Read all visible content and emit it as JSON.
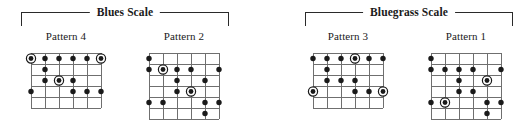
{
  "document": {
    "kind": "guitar-scale-pattern-chart",
    "background_color": "#ffffff",
    "ink_color": "#1a1a1a",
    "grid_color": "#6f6f6f"
  },
  "groups": [
    {
      "id": "blues",
      "title": "Blues Scale",
      "left": 21,
      "width": 208
    },
    {
      "id": "bluegrass",
      "title": "Bluegrass Scale",
      "left": 305,
      "width": 208
    }
  ],
  "patterns": [
    {
      "id": "pattern-4",
      "label": "Pattern 4",
      "group": "blues",
      "left": 16,
      "top": 30,
      "cell_width": 100,
      "strings": 6,
      "frets": 5,
      "string_spacing": 14,
      "fret_spacing": 11,
      "dots": [
        {
          "string": 1,
          "fret": 1,
          "root": true
        },
        {
          "string": 2,
          "fret": 1,
          "root": false
        },
        {
          "string": 3,
          "fret": 1,
          "root": false
        },
        {
          "string": 4,
          "fret": 1,
          "root": false
        },
        {
          "string": 5,
          "fret": 1,
          "root": false
        },
        {
          "string": 6,
          "fret": 1,
          "root": true
        },
        {
          "string": 2,
          "fret": 2,
          "root": false
        },
        {
          "string": 2,
          "fret": 3,
          "root": false
        },
        {
          "string": 3,
          "fret": 3,
          "root": true
        },
        {
          "string": 4,
          "fret": 3,
          "root": false
        },
        {
          "string": 1,
          "fret": 4,
          "root": false
        },
        {
          "string": 4,
          "fret": 4,
          "root": false
        },
        {
          "string": 5,
          "fret": 4,
          "root": false
        },
        {
          "string": 6,
          "fret": 4,
          "root": false
        }
      ]
    },
    {
      "id": "pattern-2",
      "label": "Pattern 2",
      "group": "blues",
      "left": 134,
      "top": 30,
      "cell_width": 100,
      "strings": 6,
      "frets": 6,
      "string_spacing": 14,
      "fret_spacing": 11,
      "dots": [
        {
          "string": 1,
          "fret": 1,
          "root": false
        },
        {
          "string": 1,
          "fret": 2,
          "root": false
        },
        {
          "string": 2,
          "fret": 2,
          "root": true
        },
        {
          "string": 3,
          "fret": 2,
          "root": false
        },
        {
          "string": 4,
          "fret": 2,
          "root": false
        },
        {
          "string": 6,
          "fret": 2,
          "root": false
        },
        {
          "string": 3,
          "fret": 3,
          "root": false
        },
        {
          "string": 5,
          "fret": 3,
          "root": false
        },
        {
          "string": 3,
          "fret": 4,
          "root": false
        },
        {
          "string": 4,
          "fret": 4,
          "root": true
        },
        {
          "string": 1,
          "fret": 5,
          "root": false
        },
        {
          "string": 2,
          "fret": 5,
          "root": false
        },
        {
          "string": 5,
          "fret": 5,
          "root": false
        },
        {
          "string": 6,
          "fret": 5,
          "root": false
        },
        {
          "string": 5,
          "fret": 6,
          "root": false
        }
      ]
    },
    {
      "id": "pattern-3",
      "label": "Pattern 3",
      "group": "bluegrass",
      "left": 298,
      "top": 30,
      "cell_width": 100,
      "strings": 6,
      "frets": 5,
      "string_spacing": 14,
      "fret_spacing": 11,
      "dots": [
        {
          "string": 1,
          "fret": 1,
          "root": false
        },
        {
          "string": 2,
          "fret": 1,
          "root": false
        },
        {
          "string": 3,
          "fret": 1,
          "root": false
        },
        {
          "string": 4,
          "fret": 1,
          "root": true
        },
        {
          "string": 5,
          "fret": 1,
          "root": false
        },
        {
          "string": 6,
          "fret": 1,
          "root": false
        },
        {
          "string": 2,
          "fret": 2,
          "root": false
        },
        {
          "string": 2,
          "fret": 3,
          "root": false
        },
        {
          "string": 3,
          "fret": 3,
          "root": false
        },
        {
          "string": 4,
          "fret": 3,
          "root": false
        },
        {
          "string": 1,
          "fret": 4,
          "root": true
        },
        {
          "string": 4,
          "fret": 4,
          "root": false
        },
        {
          "string": 5,
          "fret": 4,
          "root": false
        },
        {
          "string": 6,
          "fret": 4,
          "root": true
        }
      ]
    },
    {
      "id": "pattern-1",
      "label": "Pattern 1",
      "group": "bluegrass",
      "left": 416,
      "top": 30,
      "cell_width": 100,
      "strings": 6,
      "frets": 6,
      "string_spacing": 14,
      "fret_spacing": 11,
      "dots": [
        {
          "string": 1,
          "fret": 1,
          "root": false
        },
        {
          "string": 1,
          "fret": 2,
          "root": false
        },
        {
          "string": 2,
          "fret": 2,
          "root": false
        },
        {
          "string": 3,
          "fret": 2,
          "root": false
        },
        {
          "string": 4,
          "fret": 2,
          "root": false
        },
        {
          "string": 6,
          "fret": 2,
          "root": false
        },
        {
          "string": 3,
          "fret": 3,
          "root": false
        },
        {
          "string": 5,
          "fret": 3,
          "root": true
        },
        {
          "string": 3,
          "fret": 4,
          "root": false
        },
        {
          "string": 4,
          "fret": 4,
          "root": false
        },
        {
          "string": 1,
          "fret": 5,
          "root": false
        },
        {
          "string": 2,
          "fret": 5,
          "root": true
        },
        {
          "string": 5,
          "fret": 5,
          "root": false
        },
        {
          "string": 6,
          "fret": 5,
          "root": false
        },
        {
          "string": 5,
          "fret": 6,
          "root": false
        }
      ]
    }
  ]
}
